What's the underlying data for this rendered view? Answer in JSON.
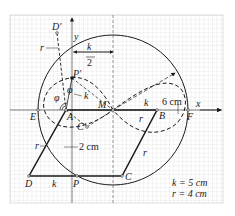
{
  "diagram": {
    "axes": {
      "x_label": "x",
      "y_label": "y"
    },
    "points": {
      "D_prime": "D′",
      "P_prime": "P′",
      "M": "M",
      "E": "E",
      "A": "A",
      "B": "B",
      "F": "F",
      "C_prime": "C′",
      "D": "D",
      "P": "P",
      "C": "C"
    },
    "dimension_labels": {
      "half_k_num": "k",
      "half_k_den": "2",
      "six_cm": "6 cm",
      "two_cm": "2 cm",
      "k_AM": "k",
      "k_bottom": "k",
      "k_P": "k",
      "r_top": "r",
      "r_left": "r",
      "r_right": "r",
      "r_bottom": "r",
      "phi_1": "φ",
      "phi_2": "φ"
    },
    "legend": {
      "k_line": "k = 5 cm",
      "r_line": "r = 4 cm"
    },
    "colors": {
      "grid_minor": "#d6d6d6",
      "grid_major": "#bdbdbd",
      "ink": "#1a1a1a"
    }
  }
}
